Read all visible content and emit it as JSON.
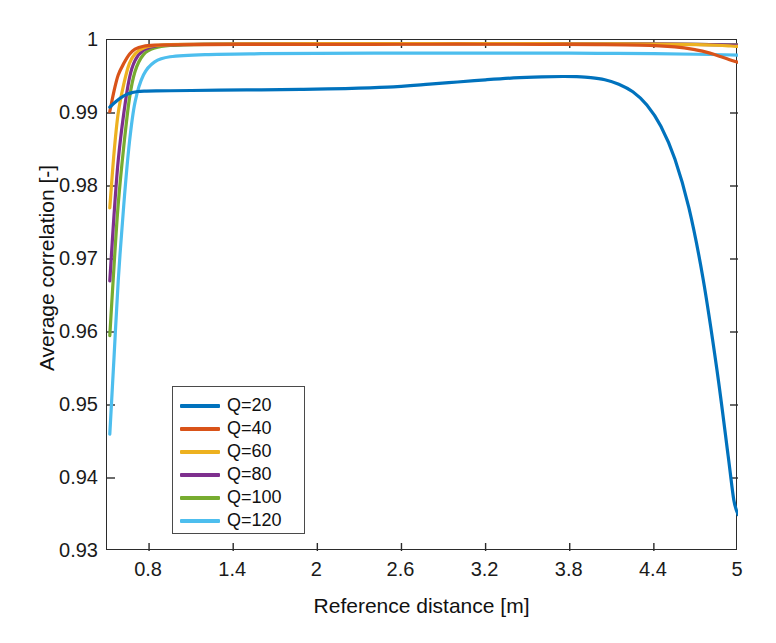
{
  "chart_data": {
    "type": "line",
    "title": "",
    "xlabel": "Reference distance [m]",
    "ylabel": "Average correlation [-]",
    "xlim": [
      0.5,
      5.0
    ],
    "ylim": [
      0.93,
      1.0
    ],
    "xticks": [
      0.8,
      1.4,
      2.0,
      2.6,
      3.2,
      3.8,
      4.4,
      5.0
    ],
    "xtick_labels": [
      "0.8",
      "1.4",
      "2",
      "2.6",
      "3.2",
      "3.8",
      "4.4",
      "5"
    ],
    "yticks": [
      0.93,
      0.94,
      0.95,
      0.96,
      0.97,
      0.98,
      0.99,
      1.0
    ],
    "ytick_labels": [
      "0.93",
      "0.94",
      "0.95",
      "0.96",
      "0.97",
      "0.98",
      "0.99",
      "1"
    ],
    "grid": false,
    "legend_position": "lower-left-inside",
    "box": true,
    "tick_direction": "in",
    "series": [
      {
        "name": "Q=20",
        "color": "#0072BD",
        "x": [
          0.52,
          0.56,
          0.6,
          0.64,
          0.68,
          0.72,
          0.78,
          0.85,
          0.95,
          1.1,
          1.3,
          1.6,
          1.9,
          2.2,
          2.5,
          2.8,
          3.0,
          3.2,
          3.4,
          3.6,
          3.75,
          3.85,
          3.95,
          4.05,
          4.15,
          4.25,
          4.35,
          4.45,
          4.55,
          4.65,
          4.75,
          4.85,
          4.93,
          4.97,
          5.0
        ],
        "y": [
          0.9908,
          0.9915,
          0.9921,
          0.99255,
          0.9928,
          0.99295,
          0.993,
          0.99303,
          0.99305,
          0.99308,
          0.99312,
          0.99318,
          0.99325,
          0.99335,
          0.99355,
          0.99395,
          0.99425,
          0.99455,
          0.9948,
          0.99495,
          0.995,
          0.99497,
          0.99485,
          0.99455,
          0.99395,
          0.9929,
          0.9911,
          0.9882,
          0.9837,
          0.977,
          0.9674,
          0.9548,
          0.943,
          0.937,
          0.935
        ]
      },
      {
        "name": "Q=40",
        "color": "#D95319",
        "x": [
          0.52,
          0.55,
          0.58,
          0.62,
          0.66,
          0.7,
          0.76,
          0.84,
          0.95,
          1.2,
          1.6,
          2.0,
          2.4,
          2.8,
          3.2,
          3.6,
          4.0,
          4.3,
          4.55,
          4.7,
          4.8,
          4.88,
          4.94,
          4.98,
          5.0
        ],
        "y": [
          0.9902,
          0.993,
          0.9952,
          0.9968,
          0.99805,
          0.99875,
          0.99915,
          0.9993,
          0.99935,
          0.99938,
          0.9994,
          0.99941,
          0.99941,
          0.99942,
          0.99942,
          0.99941,
          0.99938,
          0.9993,
          0.99905,
          0.99865,
          0.9982,
          0.9977,
          0.9973,
          0.99705,
          0.99695
        ]
      },
      {
        "name": "Q=60",
        "color": "#EDB120",
        "x": [
          0.52,
          0.55,
          0.58,
          0.62,
          0.66,
          0.7,
          0.76,
          0.84,
          0.95,
          1.2,
          1.6,
          2.0,
          2.4,
          2.8,
          3.2,
          3.6,
          4.0,
          4.4,
          4.7,
          4.85,
          4.95,
          5.0
        ],
        "y": [
          0.977,
          0.9845,
          0.99,
          0.994,
          0.9968,
          0.9981,
          0.9989,
          0.99925,
          0.99938,
          0.99945,
          0.99948,
          0.99949,
          0.9995,
          0.9995,
          0.9995,
          0.99949,
          0.99948,
          0.99944,
          0.99936,
          0.99928,
          0.99918,
          0.99912
        ]
      },
      {
        "name": "Q=80",
        "color": "#7E2F8E",
        "x": [
          0.52,
          0.55,
          0.58,
          0.62,
          0.66,
          0.7,
          0.76,
          0.84,
          0.95,
          1.2,
          1.6,
          2.0,
          2.4,
          2.8,
          3.2,
          3.6,
          4.0,
          4.4,
          4.7,
          4.9,
          5.0
        ],
        "y": [
          0.967,
          0.976,
          0.9835,
          0.99,
          0.9948,
          0.9972,
          0.9986,
          0.99915,
          0.99933,
          0.99944,
          0.99948,
          0.9995,
          0.99951,
          0.99951,
          0.99951,
          0.9995,
          0.99949,
          0.99946,
          0.9994,
          0.99934,
          0.9993
        ]
      },
      {
        "name": "Q=100",
        "color": "#77AC30",
        "x": [
          0.52,
          0.55,
          0.58,
          0.62,
          0.66,
          0.7,
          0.76,
          0.84,
          0.95,
          1.2,
          1.6,
          2.0,
          2.4,
          2.8,
          3.2,
          3.6,
          4.0,
          4.4,
          4.7,
          4.9,
          5.0
        ],
        "y": [
          0.9595,
          0.969,
          0.9775,
          0.9855,
          0.992,
          0.9957,
          0.998,
          0.9989,
          0.99925,
          0.9994,
          0.99946,
          0.99948,
          0.99949,
          0.9995,
          0.9995,
          0.99949,
          0.99948,
          0.99945,
          0.9994,
          0.99935,
          0.99932
        ]
      },
      {
        "name": "Q=120",
        "color": "#4DBEEE",
        "x": [
          0.52,
          0.55,
          0.58,
          0.62,
          0.66,
          0.7,
          0.76,
          0.84,
          0.95,
          1.2,
          1.6,
          2.0,
          2.4,
          2.8,
          3.2,
          3.6,
          4.0,
          4.4,
          4.7,
          4.9,
          5.0
        ],
        "y": [
          0.946,
          0.9565,
          0.967,
          0.9775,
          0.986,
          0.9915,
          0.9952,
          0.997,
          0.9977,
          0.998,
          0.99812,
          0.99818,
          0.9982,
          0.99821,
          0.99821,
          0.9982,
          0.99818,
          0.99812,
          0.99805,
          0.99798,
          0.99793
        ]
      }
    ]
  },
  "legend": {
    "entries": [
      {
        "label": "Q=20",
        "color": "#0072BD"
      },
      {
        "label": "Q=40",
        "color": "#D95319"
      },
      {
        "label": "Q=60",
        "color": "#EDB120"
      },
      {
        "label": "Q=80",
        "color": "#7E2F8E"
      },
      {
        "label": "Q=100",
        "color": "#77AC30"
      },
      {
        "label": "Q=120",
        "color": "#4DBEEE"
      }
    ]
  },
  "axes": {
    "x_title": "Reference distance [m]",
    "y_title": "Average correlation [-]"
  }
}
